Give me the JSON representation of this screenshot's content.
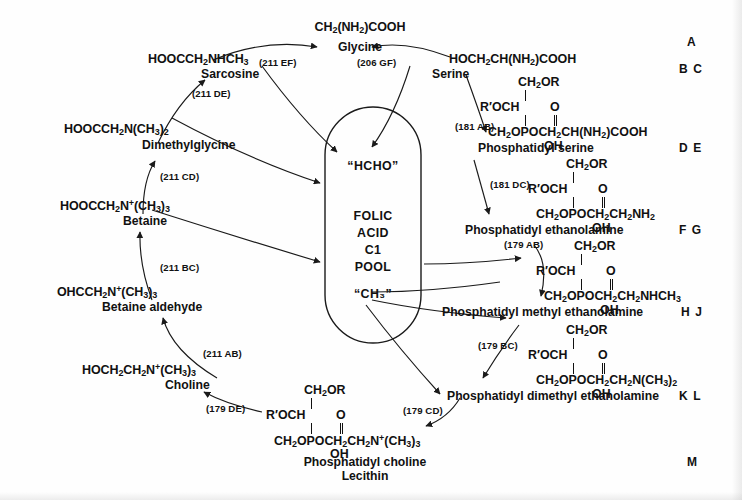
{
  "diagram": {
    "pool": {
      "top_label": "“HCHO”",
      "bottom_label": "“CH₃”",
      "center_lines": [
        "FOLIC",
        "ACID",
        "C1",
        "POOL"
      ]
    },
    "row_labels": [
      {
        "id": "A",
        "text": "A"
      },
      {
        "id": "BC",
        "text": "B C"
      },
      {
        "id": "DE",
        "text": "D E"
      },
      {
        "id": "FG",
        "text": "F G"
      },
      {
        "id": "HJ",
        "text": "H J"
      },
      {
        "id": "KL",
        "text": "K L"
      },
      {
        "id": "M",
        "text": "M"
      }
    ],
    "compounds": [
      {
        "id": "glycine",
        "formula_html": "CH<sub>2</sub>(NH<sub>2</sub>)COOH",
        "name": "Glycine"
      },
      {
        "id": "sarcosine",
        "formula_html": "HOOCCH<sub>2</sub>NHCH<sub>3</sub>",
        "name": "Sarcosine"
      },
      {
        "id": "dimethylglycine",
        "formula_html": "HOOCCH<sub>2</sub>N(CH<sub>3</sub>)<sub>2</sub>",
        "name": "Dimethylglycine"
      },
      {
        "id": "betaine",
        "formula_html": "HOOCCH<sub>2</sub>N<sup>+</sup>(CH<sub>3</sub>)<sub>3</sub>",
        "name": "Betaine"
      },
      {
        "id": "betaine_aldehyde",
        "formula_html": "OHCCH<sub>2</sub>N<sup>+</sup>(CH<sub>3</sub>)<sub>3</sub>",
        "name": "Betaine aldehyde"
      },
      {
        "id": "choline",
        "formula_html": "HOCH<sub>2</sub>CH<sub>2</sub>N<sup>+</sup>(CH<sub>3</sub>)<sub>3</sub>",
        "name": "Choline"
      },
      {
        "id": "serine",
        "formula_html": "HOCH<sub>2</sub>CH(NH<sub>2</sub>)COOH",
        "name": "Serine"
      },
      {
        "id": "phosphatidyl_serine",
        "name": "Phosphatidyl serine"
      },
      {
        "id": "phosphatidyl_ethanolamine",
        "name": "Phosphatidyl ethanolamine"
      },
      {
        "id": "phosphatidyl_methyl_ethanolamine",
        "name": "Phosphatidyl methyl ethanolamine"
      },
      {
        "id": "phosphatidyl_dimethyl_ethanolamine",
        "name": "Phosphatidyl dimethyl ethanolamine"
      },
      {
        "id": "phosphatidyl_choline",
        "name": "Phosphatidyl choline",
        "name2": "Lecithin"
      }
    ],
    "structures": [
      {
        "id": "struct_phosphatidyl_serine",
        "top": "CH<sub>2</sub>OR",
        "mid_left": "R′OCH",
        "carbonyl": "O",
        "bottom": "CH<sub>2</sub>OPOCH<sub>2</sub>CH(NH<sub>2</sub>)COOH",
        "oh": "OH"
      },
      {
        "id": "struct_phosphatidyl_ethanolamine",
        "top": "CH<sub>2</sub>OR",
        "mid_left": "R′OCH",
        "carbonyl": "O",
        "bottom": "CH<sub>2</sub>OPOCH<sub>2</sub>CH<sub>2</sub>NH<sub>2</sub>",
        "oh": "OH"
      },
      {
        "id": "struct_phosphatidyl_methyl_ethanolamine",
        "top": "CH<sub>2</sub>OR",
        "mid_left": "R′OCH",
        "carbonyl": "O",
        "bottom": "CH<sub>2</sub>OPOCH<sub>2</sub>CH<sub>2</sub>NHCH<sub>3</sub>",
        "oh": "OH"
      },
      {
        "id": "struct_phosphatidyl_dimethyl_ethanolamine",
        "top": "CH<sub>2</sub>OR",
        "mid_left": "R′OCH",
        "carbonyl": "O",
        "bottom": "CH<sub>2</sub>OPOCH<sub>2</sub>CH<sub>2</sub>N(CH<sub>3</sub>)<sub>2</sub>",
        "oh": "OH"
      },
      {
        "id": "struct_phosphatidyl_choline",
        "top": "CH<sub>2</sub>OR",
        "mid_left": "R′OCH",
        "carbonyl": "O",
        "bottom": "CH<sub>2</sub>OPOCH<sub>2</sub>CH<sub>2</sub>N<sup>+</sup>(CH<sub>3</sub>)<sub>3</sub>",
        "oh": "OH"
      }
    ],
    "enzyme_steps": [
      {
        "id": "step_211_EF",
        "label": "(211 EF)",
        "from": "sarcosine",
        "to": "glycine"
      },
      {
        "id": "step_206_GF",
        "label": "(206 GF)",
        "from": "serine",
        "to": "glycine"
      },
      {
        "id": "step_211_DE",
        "label": "(211 DE)",
        "from": "dimethylglycine",
        "to": "sarcosine"
      },
      {
        "id": "step_211_CD",
        "label": "(211 CD)",
        "from": "betaine",
        "to": "dimethylglycine"
      },
      {
        "id": "step_211_BC",
        "label": "(211 BC)",
        "from": "betaine_aldehyde",
        "to": "betaine"
      },
      {
        "id": "step_211_AB",
        "label": "(211 AB)",
        "from": "choline",
        "to": "betaine_aldehyde"
      },
      {
        "id": "step_179_DE",
        "label": "(179 DE)",
        "from": "phosphatidyl_choline",
        "to": "choline"
      },
      {
        "id": "step_181_AB",
        "label": "(181 AB)",
        "from": "serine",
        "to": "phosphatidyl_serine"
      },
      {
        "id": "step_181_DC",
        "label": "(181 DC)",
        "from": "phosphatidyl_serine",
        "to": "phosphatidyl_ethanolamine"
      },
      {
        "id": "step_179_AB",
        "label": "(179 AB)",
        "from": "phosphatidyl_ethanolamine",
        "to": "phosphatidyl_methyl_ethanolamine"
      },
      {
        "id": "step_179_BC",
        "label": "(179 BC)",
        "from": "phosphatidyl_methyl_ethanolamine",
        "to": "phosphatidyl_dimethyl_ethanolamine"
      },
      {
        "id": "step_179_CD",
        "label": "(179 CD)",
        "from": "phosphatidyl_dimethyl_ethanolamine",
        "to": "phosphatidyl_choline"
      }
    ],
    "colors": {
      "ink": "#111111",
      "background": "#fefefe",
      "stroke": "#1a1a1a"
    }
  }
}
